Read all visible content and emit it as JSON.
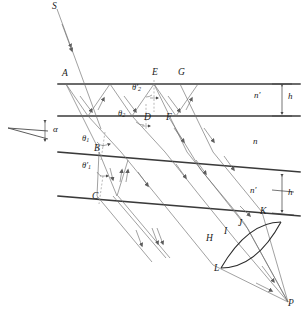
{
  "figure": {
    "colors": {
      "ray": "#6d6d6d",
      "surface": "#3a3a3a",
      "lens": "#2b2b2b",
      "label": "#1a1a1a",
      "caption": "#bcbcbc"
    }
  },
  "points": [
    {
      "id": "S",
      "label": "S",
      "x": 52,
      "y": 3,
      "role": "incident-source-ray"
    },
    {
      "id": "A",
      "label": "A",
      "x": 62,
      "y": 72,
      "role": "top-plate-upper-surface"
    },
    {
      "id": "E",
      "label": "E",
      "x": 154,
      "y": 71,
      "role": "top-plate-upper-surface"
    },
    {
      "id": "G",
      "label": "G",
      "x": 180,
      "y": 71,
      "role": "top-plate-upper-surface"
    },
    {
      "id": "D",
      "label": "D",
      "x": 146,
      "y": 116,
      "role": "top-plate-lower-surface"
    },
    {
      "id": "F",
      "label": "F",
      "x": 168,
      "y": 116,
      "role": "top-plate-lower-surface"
    },
    {
      "id": "B",
      "label": "B",
      "x": 98,
      "y": 150,
      "role": "bottom-plate-upper-surface"
    },
    {
      "id": "C",
      "label": "C",
      "x": 97,
      "y": 195,
      "role": "bottom-plate-lower-surface"
    },
    {
      "id": "H",
      "label": "H",
      "x": 208,
      "y": 238,
      "role": "emergent-ray"
    },
    {
      "id": "I",
      "label": "I",
      "x": 226,
      "y": 231,
      "role": "emergent-ray"
    },
    {
      "id": "J",
      "label": "J",
      "x": 240,
      "y": 223,
      "role": "emergent-ray"
    },
    {
      "id": "K",
      "label": "K",
      "x": 262,
      "y": 211,
      "role": "bottom-plate-lower-surface"
    },
    {
      "id": "L",
      "label": "L",
      "x": 218,
      "y": 268,
      "role": "lens-edge"
    },
    {
      "id": "P",
      "label": "P",
      "x": 290,
      "y": 303,
      "role": "focal-point"
    }
  ],
  "media": [
    {
      "label": "n′",
      "x": 256,
      "y": 96,
      "name": "index-top-plate"
    },
    {
      "label": "n",
      "x": 254,
      "y": 141,
      "name": "index-gap"
    },
    {
      "label": "n′",
      "x": 252,
      "y": 190,
      "name": "index-bottom-plate"
    }
  ],
  "thickness": [
    {
      "label": "h",
      "x": 284,
      "y": 96,
      "name": "thickness-top-plate"
    },
    {
      "label": "h",
      "x": 283,
      "y": 192,
      "name": "thickness-bottom-plate"
    }
  ],
  "angles": [
    {
      "label": "θ′",
      "sub": "2",
      "x": 134,
      "y": 87,
      "name": "theta-2-prime"
    },
    {
      "label": "θ",
      "sub": "2",
      "x": 121,
      "y": 113,
      "name": "theta-2"
    },
    {
      "label": "θ",
      "sub": "1",
      "x": 84,
      "y": 138,
      "name": "theta-1"
    },
    {
      "label": "θ′",
      "sub": "1",
      "x": 85,
      "y": 165,
      "name": "theta-1-prime"
    }
  ],
  "wedge": {
    "label": "α",
    "x": 55,
    "y": 128,
    "name": "wedge-angle-alpha"
  },
  "caption": {
    "text": "",
    "visible": false
  },
  "geometry": {
    "top_plate": {
      "y_upper": 84,
      "y_lower": 116,
      "x_start": 58,
      "x_end": 300
    },
    "bottom_plate": {
      "slope": 0.082,
      "y_at_x58_upper": 152,
      "y_at_x58_lower": 196
    }
  }
}
